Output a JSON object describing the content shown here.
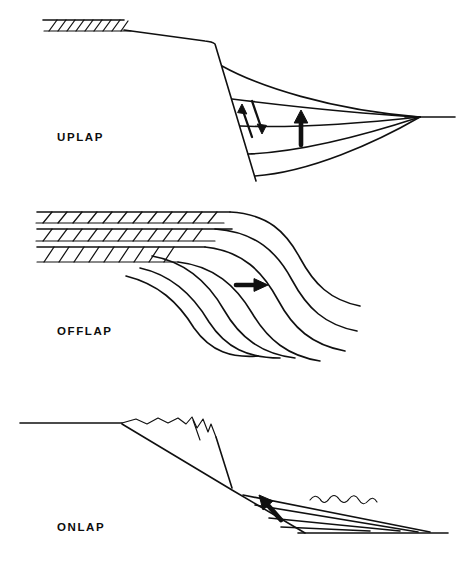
{
  "figure": {
    "width": 461,
    "height": 562,
    "background_color": "#ffffff",
    "ink_color": "#101010",
    "style": "line-art schematic cross-section, black ink on white"
  },
  "panels": [
    {
      "id": "uplap",
      "label": "UPLAP",
      "label_position": {
        "x": 57,
        "y": 131
      },
      "description": "Shelf with hatched basal unit at left, steep slope, and a set of concave-up reflector curves that converge downlap-style at a point to the right; a shear couple symbol and a vertical up arrow indicate relative motion.",
      "elements": [
        {
          "name": "hatched-shelf-band",
          "type": "hatched-band",
          "hatch_count": 9,
          "x_start": 43,
          "x_end": 125,
          "y_top": 20,
          "y_bottom": 31
        },
        {
          "name": "shelf-top-line",
          "type": "polyline",
          "points": "43,20 124,20 215,42 215,42"
        },
        {
          "name": "shelf-break",
          "type": "vertex",
          "x": 215,
          "y": 42
        },
        {
          "name": "slope-line",
          "type": "polyline",
          "points": "215,42 256,180"
        },
        {
          "name": "reflector-curve-1",
          "type": "curve"
        },
        {
          "name": "reflector-curve-2",
          "type": "curve"
        },
        {
          "name": "reflector-curve-3",
          "type": "curve"
        },
        {
          "name": "reflector-curve-4",
          "type": "curve"
        },
        {
          "name": "reflector-curve-5",
          "type": "curve"
        },
        {
          "name": "basin-floor-line",
          "type": "line",
          "x_start": 420,
          "x_end": 455,
          "y": 117
        },
        {
          "name": "convergence-point",
          "type": "point",
          "x": 420,
          "y": 117
        },
        {
          "name": "shear-couple-symbol",
          "type": "paired-arrows",
          "x": 252,
          "y": 118
        },
        {
          "name": "uplift-arrow",
          "type": "arrow",
          "direction": "up",
          "x": 301,
          "y": 128
        }
      ]
    },
    {
      "id": "offlap",
      "label": "OFFLAP",
      "label_position": {
        "x": 57,
        "y": 325
      },
      "description": "Three stacked hatched topset bands stepping down to the right, passing into a family of sigmoid clinoform curves that sweep down to the basin; a bold horizontal arrow points basinward to the right.",
      "elements": [
        {
          "name": "hatched-topset-band-1",
          "type": "hatched-band",
          "hatch_count": 12
        },
        {
          "name": "hatched-topset-band-2",
          "type": "hatched-band",
          "hatch_count": 11
        },
        {
          "name": "hatched-topset-band-3",
          "type": "hatched-band",
          "hatch_count": 9
        },
        {
          "name": "clinoform-curve-1",
          "type": "sigmoid-curve"
        },
        {
          "name": "clinoform-curve-2",
          "type": "sigmoid-curve"
        },
        {
          "name": "clinoform-curve-3",
          "type": "sigmoid-curve"
        },
        {
          "name": "clinoform-curve-4",
          "type": "sigmoid-curve"
        },
        {
          "name": "clinoform-curve-5",
          "type": "sigmoid-curve"
        },
        {
          "name": "clinoform-curve-6",
          "type": "sigmoid-curve"
        },
        {
          "name": "clinoform-curve-7",
          "type": "sigmoid-curve"
        },
        {
          "name": "progradation-arrow",
          "type": "arrow",
          "direction": "right",
          "x": 255,
          "y": 285
        }
      ]
    },
    {
      "id": "onlap",
      "label": "ONLAP",
      "label_position": {
        "x": 57,
        "y": 521
      },
      "description": "Flat surface at left passing into an eroded jagged ridge, a straight descending slope, and a wedge of fanning layers that terminate (onlap) against the slope; a bold arrow points up-slope to the left and a wavy squiggle marks rough sea-bed relief.",
      "elements": [
        {
          "name": "upper-flat-surface",
          "type": "line",
          "x_start": 20,
          "x_end": 122,
          "y": 423
        },
        {
          "name": "eroded-ridge-crest",
          "type": "jagged-polyline"
        },
        {
          "name": "slope-line",
          "type": "line",
          "x_start": 122,
          "x_end": 305,
          "y_start": 424,
          "y_end": 533
        },
        {
          "name": "onlap-layer-1",
          "type": "line"
        },
        {
          "name": "onlap-layer-2",
          "type": "line"
        },
        {
          "name": "onlap-layer-3",
          "type": "line"
        },
        {
          "name": "onlap-layer-4",
          "type": "line"
        },
        {
          "name": "basin-floor-line",
          "type": "line",
          "x_start": 298,
          "x_end": 448,
          "y": 533
        },
        {
          "name": "onlap-arrow",
          "type": "arrow",
          "direction": "up-left",
          "x": 270,
          "y": 505
        },
        {
          "name": "seabed-squiggle",
          "type": "wavy-line"
        }
      ]
    }
  ]
}
